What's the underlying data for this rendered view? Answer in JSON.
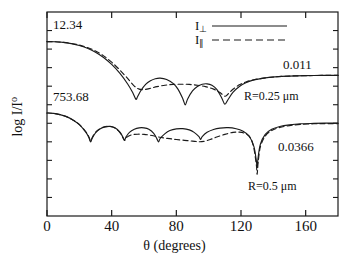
{
  "figure": {
    "domain": "scientific-plot",
    "background": "#ffffff",
    "line_color": "#1a1a1a"
  },
  "chart_data": {
    "type": "line",
    "title": "",
    "xlabel": "θ (degrees)",
    "ylabel": "log I/I",
    "ylabel_sub": "o",
    "xlim": [
      0,
      180
    ],
    "ylim": [
      0,
      1
    ],
    "xticks": [
      0,
      40,
      80,
      120,
      160
    ],
    "xticklabels": [
      "0",
      "40",
      "80",
      "120",
      "160"
    ],
    "yticks": [],
    "yticklabels": [],
    "grid": false,
    "y_axis_scale": "logarithmic (decade ticks, unlabeled)",
    "legend": {
      "position": "top-center",
      "entries": [
        {
          "name": "I",
          "subscript": "⊥",
          "style": "solid",
          "label": "I⊥"
        },
        {
          "name": "I",
          "subscript": "∥",
          "style": "dashed",
          "label": "I∥"
        }
      ]
    },
    "annotations": [
      {
        "text": "12.34",
        "role": "upper-curve-start-value",
        "x": 2,
        "y_px": 28
      },
      {
        "text": "753.68",
        "role": "lower-curve-start-value",
        "x": 2,
        "y_px": 100
      },
      {
        "text": "0.011",
        "role": "upper-curve-end-value",
        "x": 168,
        "y_px": 66
      },
      {
        "text": "0.0366",
        "role": "lower-curve-end-value",
        "x": 168,
        "y_px": 148
      },
      {
        "text": "R=0.25 μm",
        "role": "upper-curve-param",
        "x": 150,
        "y_px": 96
      },
      {
        "text": "R=0.5 μm",
        "role": "lower-curve-param",
        "x": 150,
        "y_px": 186
      }
    ],
    "series": [
      {
        "name": "I⊥ (R=0.25 μm)",
        "style": "solid",
        "group": "R=0.25 μm",
        "start_value": 12.34,
        "end_value": 0.011,
        "minima_deg": [
          55,
          85,
          110
        ],
        "points": [
          [
            0,
            0.855
          ],
          [
            5,
            0.854
          ],
          [
            10,
            0.851
          ],
          [
            15,
            0.845
          ],
          [
            20,
            0.836
          ],
          [
            25,
            0.822
          ],
          [
            30,
            0.803
          ],
          [
            35,
            0.777
          ],
          [
            40,
            0.743
          ],
          [
            45,
            0.7
          ],
          [
            50,
            0.646
          ],
          [
            53,
            0.605
          ],
          [
            55,
            0.572
          ],
          [
            56,
            0.585
          ],
          [
            58,
            0.614
          ],
          [
            61,
            0.645
          ],
          [
            64,
            0.663
          ],
          [
            67,
            0.673
          ],
          [
            70,
            0.676
          ],
          [
            74,
            0.669
          ],
          [
            78,
            0.65
          ],
          [
            81,
            0.622
          ],
          [
            84,
            0.575
          ],
          [
            85.5,
            0.545
          ],
          [
            87,
            0.574
          ],
          [
            90,
            0.613
          ],
          [
            93,
            0.635
          ],
          [
            96,
            0.646
          ],
          [
            99,
            0.648
          ],
          [
            102,
            0.641
          ],
          [
            105,
            0.621
          ],
          [
            108,
            0.58
          ],
          [
            110,
            0.548
          ],
          [
            112,
            0.571
          ],
          [
            115,
            0.606
          ],
          [
            119,
            0.635
          ],
          [
            123,
            0.653
          ],
          [
            128,
            0.667
          ],
          [
            134,
            0.676
          ],
          [
            141,
            0.682
          ],
          [
            150,
            0.686
          ],
          [
            160,
            0.688
          ],
          [
            170,
            0.689
          ],
          [
            180,
            0.689
          ]
        ]
      },
      {
        "name": "I∥ (R=0.25 μm)",
        "style": "dashed",
        "group": "R=0.25 μm",
        "start_value": 12.34,
        "end_value": 0.011,
        "minima_deg": [
          110
        ],
        "points": [
          [
            0,
            0.855
          ],
          [
            5,
            0.854
          ],
          [
            10,
            0.851
          ],
          [
            15,
            0.846
          ],
          [
            20,
            0.838
          ],
          [
            25,
            0.826
          ],
          [
            30,
            0.809
          ],
          [
            35,
            0.785
          ],
          [
            40,
            0.754
          ],
          [
            45,
            0.716
          ],
          [
            50,
            0.673
          ],
          [
            54,
            0.637
          ],
          [
            57,
            0.622
          ],
          [
            60,
            0.62
          ],
          [
            64,
            0.626
          ],
          [
            68,
            0.634
          ],
          [
            73,
            0.641
          ],
          [
            78,
            0.645
          ],
          [
            83,
            0.646
          ],
          [
            88,
            0.645
          ],
          [
            93,
            0.641
          ],
          [
            98,
            0.634
          ],
          [
            103,
            0.622
          ],
          [
            107,
            0.605
          ],
          [
            110,
            0.587
          ],
          [
            112,
            0.598
          ],
          [
            115,
            0.621
          ],
          [
            119,
            0.643
          ],
          [
            123,
            0.657
          ],
          [
            128,
            0.668
          ],
          [
            134,
            0.676
          ],
          [
            141,
            0.682
          ],
          [
            150,
            0.686
          ],
          [
            160,
            0.688
          ],
          [
            170,
            0.689
          ],
          [
            180,
            0.689
          ]
        ]
      },
      {
        "name": "I⊥ (R=0.5 μm)",
        "style": "solid",
        "group": "R=0.5 μm",
        "start_value": 753.68,
        "end_value": 0.0366,
        "minima_deg": [
          27,
          47,
          68,
          95,
          130
        ],
        "points": [
          [
            0,
            0.505
          ],
          [
            4,
            0.503
          ],
          [
            8,
            0.497
          ],
          [
            12,
            0.487
          ],
          [
            16,
            0.471
          ],
          [
            20,
            0.448
          ],
          [
            24,
            0.411
          ],
          [
            26,
            0.383
          ],
          [
            27,
            0.363
          ],
          [
            28,
            0.382
          ],
          [
            30,
            0.408
          ],
          [
            33,
            0.428
          ],
          [
            36,
            0.437
          ],
          [
            39,
            0.439
          ],
          [
            42,
            0.432
          ],
          [
            45,
            0.412
          ],
          [
            47,
            0.386
          ],
          [
            48,
            0.372
          ],
          [
            49,
            0.389
          ],
          [
            51,
            0.41
          ],
          [
            54,
            0.425
          ],
          [
            57,
            0.432
          ],
          [
            60,
            0.432
          ],
          [
            63,
            0.425
          ],
          [
            66,
            0.405
          ],
          [
            68,
            0.378
          ],
          [
            69,
            0.363
          ],
          [
            70,
            0.38
          ],
          [
            73,
            0.404
          ],
          [
            76,
            0.419
          ],
          [
            80,
            0.427
          ],
          [
            84,
            0.428
          ],
          [
            88,
            0.422
          ],
          [
            91,
            0.41
          ],
          [
            94,
            0.389
          ],
          [
            95,
            0.375
          ],
          [
            96,
            0.389
          ],
          [
            99,
            0.41
          ],
          [
            103,
            0.424
          ],
          [
            107,
            0.431
          ],
          [
            112,
            0.433
          ],
          [
            117,
            0.428
          ],
          [
            121,
            0.417
          ],
          [
            125,
            0.392
          ],
          [
            128,
            0.34
          ],
          [
            129.5,
            0.27
          ],
          [
            130,
            0.238
          ],
          [
            130.5,
            0.282
          ],
          [
            132,
            0.352
          ],
          [
            135,
            0.4
          ],
          [
            139,
            0.425
          ],
          [
            144,
            0.439
          ],
          [
            150,
            0.447
          ],
          [
            157,
            0.452
          ],
          [
            165,
            0.454
          ],
          [
            172,
            0.455
          ],
          [
            180,
            0.455
          ]
        ]
      },
      {
        "name": "I∥ (R=0.5 μm)",
        "style": "dashed",
        "group": "R=0.5 μm",
        "start_value": 753.68,
        "end_value": 0.0366,
        "minima_deg": [
          27,
          47,
          130
        ],
        "points": [
          [
            0,
            0.505
          ],
          [
            4,
            0.503
          ],
          [
            8,
            0.497
          ],
          [
            12,
            0.487
          ],
          [
            16,
            0.471
          ],
          [
            20,
            0.449
          ],
          [
            24,
            0.413
          ],
          [
            26,
            0.386
          ],
          [
            27,
            0.367
          ],
          [
            28,
            0.385
          ],
          [
            30,
            0.41
          ],
          [
            33,
            0.429
          ],
          [
            36,
            0.438
          ],
          [
            39,
            0.439
          ],
          [
            42,
            0.431
          ],
          [
            45,
            0.41
          ],
          [
            47,
            0.383
          ],
          [
            48,
            0.37
          ],
          [
            49,
            0.384
          ],
          [
            52,
            0.397
          ],
          [
            56,
            0.401
          ],
          [
            60,
            0.4
          ],
          [
            64,
            0.396
          ],
          [
            68,
            0.389
          ],
          [
            72,
            0.383
          ],
          [
            76,
            0.379
          ],
          [
            80,
            0.375
          ],
          [
            85,
            0.371
          ],
          [
            90,
            0.367
          ],
          [
            94,
            0.364
          ],
          [
            97,
            0.366
          ],
          [
            101,
            0.375
          ],
          [
            105,
            0.387
          ],
          [
            110,
            0.4
          ],
          [
            115,
            0.41
          ],
          [
            119,
            0.411
          ],
          [
            123,
            0.403
          ],
          [
            126,
            0.38
          ],
          [
            128,
            0.33
          ],
          [
            129.5,
            0.25
          ],
          [
            130,
            0.205
          ],
          [
            130.6,
            0.262
          ],
          [
            132,
            0.34
          ],
          [
            135,
            0.392
          ],
          [
            139,
            0.419
          ],
          [
            144,
            0.434
          ],
          [
            150,
            0.443
          ],
          [
            157,
            0.449
          ],
          [
            165,
            0.452
          ],
          [
            172,
            0.453
          ],
          [
            180,
            0.453
          ]
        ]
      }
    ]
  }
}
